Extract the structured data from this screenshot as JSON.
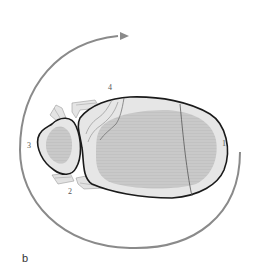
{
  "figure": {
    "panel_label": "b",
    "labels": [
      {
        "id": "1",
        "text": "1"
      },
      {
        "id": "2",
        "text": "2"
      },
      {
        "id": "3",
        "text": "3"
      },
      {
        "id": "4",
        "text": "4"
      }
    ],
    "colors": {
      "background": "#ffffff",
      "arrow": "#8a8a8a",
      "outline": "#1a1a1a",
      "outer_fill": "#e6e6e6",
      "inner_fill": "#c8c8c8",
      "fragment_fill": "#dcdcdc",
      "crack": "#555555"
    },
    "elements": {
      "rotation_arrow": "curved rotation arrow",
      "large_body": "large oval body with inner shaded core",
      "small_body": "small oval body with inner shaded core",
      "fragments": "fractured edge fragments"
    }
  }
}
